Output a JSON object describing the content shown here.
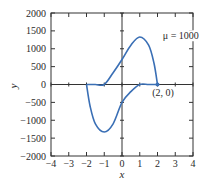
{
  "chart_data": {
    "type": "line",
    "title": "",
    "xlabel": "x",
    "ylabel": "y",
    "xlim": [
      -4,
      4
    ],
    "ylim": [
      -2000,
      2000
    ],
    "x_ticks": [
      -4,
      -3,
      -2,
      -1,
      0,
      1,
      2,
      3,
      4
    ],
    "x_tick_labels": [
      "−4",
      "−3",
      "−2",
      "−1",
      "0",
      "1",
      "2",
      "3",
      "4"
    ],
    "y_ticks": [
      2000,
      1500,
      1000,
      500,
      0,
      -500,
      -1000,
      -1500,
      -2000
    ],
    "y_tick_labels": [
      "2000",
      "1500",
      "1000",
      "500",
      "0",
      "−500",
      "−1000",
      "−1500",
      "−2000"
    ],
    "grid": false,
    "series": [
      {
        "name": "upper branch",
        "x": [
          -2,
          -1.5,
          -1,
          -0.5,
          0,
          0.5,
          1,
          1.5,
          1.8,
          2
        ],
        "y": [
          0,
          0,
          0,
          330,
          700,
          1100,
          1330,
          1100,
          600,
          0
        ]
      },
      {
        "name": "lower branch",
        "x": [
          -2,
          -1.8,
          -1.5,
          -1,
          -0.5,
          0,
          0.5,
          1,
          1.5,
          2
        ],
        "y": [
          0,
          -600,
          -1100,
          -1330,
          -1100,
          -500,
          -200,
          0,
          0,
          0
        ]
      }
    ],
    "annotations": [
      {
        "text": "μ = 1000",
        "x": 2.3,
        "y": 1350
      },
      {
        "text": "(2, 0)",
        "x": 1.7,
        "y": -250,
        "marker_x": 2,
        "marker_y": 0
      }
    ],
    "line_color": "#3a6fb5"
  }
}
